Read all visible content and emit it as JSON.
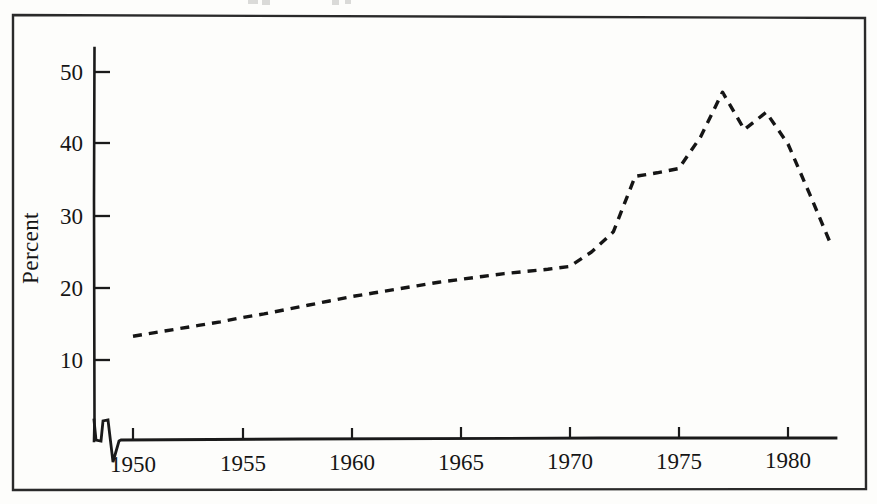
{
  "figure": {
    "kind": "scanned-line-chart",
    "background_color": "#fdfdfb",
    "ink_color": "#151515",
    "clipped_top_caption": "Figure"
  },
  "axes": {
    "y_title": "Percent",
    "y_ticks": [
      "10",
      "20",
      "30",
      "40",
      "50"
    ],
    "x_ticks": [
      "1950",
      "1955",
      "1960",
      "1965",
      "1970",
      "1975",
      "1980"
    ]
  },
  "chart_data": {
    "type": "line",
    "title": "",
    "subtitle": "",
    "xlabel": "",
    "ylabel": "Percent",
    "xlim": [
      1947.5,
      1982.5
    ],
    "ylim": [
      0,
      55
    ],
    "x_ticks": [
      1950,
      1955,
      1960,
      1965,
      1970,
      1975,
      1980
    ],
    "y_ticks": [
      10,
      20,
      30,
      40,
      50
    ],
    "grid": false,
    "legend": null,
    "legend_position": "none",
    "line_style": "dashed",
    "line_color": "#151515",
    "markers": false,
    "series": [
      {
        "name": "Percent",
        "x": [
          1950,
          1951,
          1952,
          1953,
          1954,
          1955,
          1956,
          1957,
          1958,
          1959,
          1960,
          1961,
          1962,
          1963,
          1964,
          1965,
          1966,
          1967,
          1968,
          1969,
          1970,
          1971,
          1972,
          1973,
          1974,
          1975,
          1976,
          1977,
          1978,
          1979,
          1980,
          1981,
          1982
        ],
        "values": [
          13.3,
          13.8,
          14.3,
          14.8,
          15.3,
          15.9,
          16.4,
          17.0,
          17.6,
          18.2,
          18.8,
          19.3,
          19.8,
          20.3,
          20.8,
          21.2,
          21.6,
          22.0,
          22.3,
          22.6,
          23.0,
          25.0,
          27.8,
          35.5,
          36.0,
          36.6,
          41.0,
          47.2,
          42.0,
          44.4,
          40.0,
          33.0,
          25.8
        ]
      }
    ],
    "annotations": [
      {
        "text": "scan artifact zigzag on baseline near 1948-1949",
        "x": 1948.6,
        "y": 0
      }
    ]
  },
  "geometry": {
    "frame": {
      "x": 12,
      "y": 14,
      "w": 854,
      "h": 476
    },
    "plot_origin": {
      "x": 94,
      "y": 440
    },
    "x_pixels": {
      "1950": 133,
      "1955": 243,
      "1960": 352,
      "1965": 461,
      "1970": 570,
      "1975": 679,
      "1980": 788
    },
    "y_pixels": {
      "10": 360,
      "20": 288,
      "30": 216,
      "40": 143,
      "50": 72
    }
  }
}
